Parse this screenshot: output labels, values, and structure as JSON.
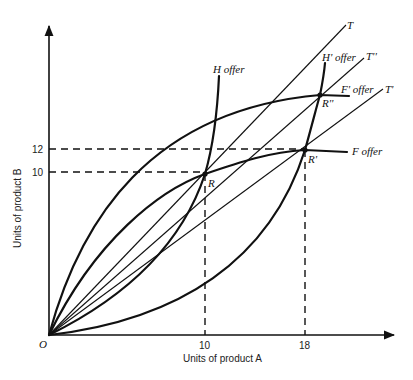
{
  "diagram": {
    "type": "offer-curve trade diagram",
    "axes": {
      "x_label": "Units of product A",
      "y_label": "Units of product B",
      "origin_label": "O",
      "x_ticks": [
        "10",
        "18"
      ],
      "y_ticks": [
        "12",
        "10"
      ]
    },
    "curves": {
      "h_offer": "H offer",
      "h_prime_offer": "H' offer",
      "f_offer": "F offer",
      "f_prime_offer": "F' offer"
    },
    "terms_of_trade_lines": {
      "t": "T",
      "t_double_prime": "T''",
      "t_prime": "T'"
    },
    "points": {
      "r": "R",
      "r_prime": "R'",
      "r_double_prime": "R''"
    }
  }
}
